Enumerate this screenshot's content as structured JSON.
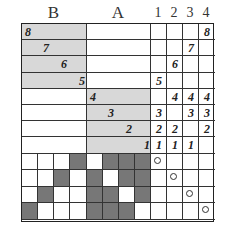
{
  "headers": {
    "B": "B",
    "A": "A",
    "cols": [
      "1",
      "2",
      "3",
      "4"
    ]
  },
  "top_rows": [
    {
      "label": "8",
      "region": "B",
      "indent": 0,
      "marks": [
        "",
        "",
        "",
        "8"
      ]
    },
    {
      "label": "7",
      "region": "B",
      "indent": 1,
      "marks": [
        "",
        "",
        "7",
        ""
      ]
    },
    {
      "label": "6",
      "region": "B",
      "indent": 2,
      "marks": [
        "",
        "6",
        "",
        ""
      ]
    },
    {
      "label": "5",
      "region": "B",
      "indent": 3,
      "marks": [
        "5",
        "",
        "",
        ""
      ]
    },
    {
      "label": "4",
      "region": "A",
      "indent": 0,
      "marks": [
        "",
        "4",
        "4",
        "4"
      ]
    },
    {
      "label": "3",
      "region": "A",
      "indent": 1,
      "marks": [
        "3",
        "",
        "3",
        "3"
      ]
    },
    {
      "label": "2",
      "region": "A",
      "indent": 2,
      "marks": [
        "2",
        "2",
        "",
        "2"
      ]
    },
    {
      "label": "1",
      "region": "A",
      "indent": 3,
      "marks": [
        "1",
        "1",
        "1",
        ""
      ]
    }
  ],
  "bottom_grid": [
    [
      0,
      0,
      0,
      1,
      0,
      1,
      1,
      1
    ],
    [
      0,
      0,
      1,
      0,
      1,
      0,
      1,
      1
    ],
    [
      0,
      1,
      0,
      0,
      1,
      1,
      0,
      1
    ],
    [
      1,
      0,
      0,
      0,
      1,
      1,
      1,
      0
    ]
  ],
  "colors": {
    "shade": "#d8d8d8",
    "dark": "#777777",
    "line": "#333333"
  }
}
